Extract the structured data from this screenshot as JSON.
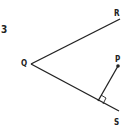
{
  "problem": {
    "number": "3"
  },
  "diagram": {
    "points": {
      "Q": {
        "label": "Q",
        "x": 31,
        "y": 64
      },
      "R": {
        "label": "R",
        "x": 120,
        "y": 19
      },
      "S": {
        "label": "S",
        "x": 119,
        "y": 111
      },
      "P": {
        "label": "P",
        "x": 118,
        "y": 66
      },
      "F": {
        "x": 98,
        "y": 101
      }
    },
    "segments": [
      "QR",
      "QS",
      "PF"
    ],
    "right_angle_at": "F",
    "stroke_color": "#222222"
  }
}
